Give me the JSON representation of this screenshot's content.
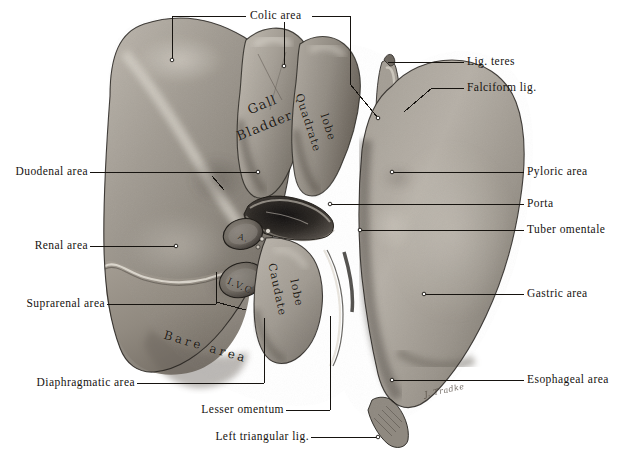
{
  "figure": {
    "type": "anatomical-illustration",
    "style": "halftone grayscale plate",
    "background_color": "#ffffff",
    "leader_line_color": "#1a1a1a",
    "signature": "J. Tradke"
  },
  "labels": {
    "top": [
      {
        "id": "colic-area",
        "text": "Colic area",
        "x": 277,
        "y": 12,
        "align": "center"
      }
    ],
    "right": [
      {
        "id": "lig-teres",
        "text": "Lig. teres",
        "x": 467,
        "y": 56
      },
      {
        "id": "falciform-lig",
        "text": "Falciform lig.",
        "x": 467,
        "y": 82
      },
      {
        "id": "pyloric-area",
        "text": "Pyloric area",
        "x": 527,
        "y": 166
      },
      {
        "id": "porta",
        "text": "Porta",
        "x": 527,
        "y": 198
      },
      {
        "id": "tuber-omentale",
        "text": "Tuber omentale",
        "x": 527,
        "y": 224
      },
      {
        "id": "gastric-area",
        "text": "Gastric area",
        "x": 527,
        "y": 288
      },
      {
        "id": "esophageal-area",
        "text": "Esophageal area",
        "x": 527,
        "y": 374
      }
    ],
    "left": [
      {
        "id": "duodenal-area",
        "text": "Duodenal area",
        "x": 96,
        "y": 166
      },
      {
        "id": "renal-area",
        "text": "Renal area",
        "x": 96,
        "y": 240
      },
      {
        "id": "suprarenal-area",
        "text": "Suprarenal area",
        "x": 113,
        "y": 298
      },
      {
        "id": "diaphragmatic-area",
        "text": "Diaphragmatic area",
        "x": 143,
        "y": 377
      }
    ],
    "bottom": [
      {
        "id": "lesser-omentum",
        "text": "Lesser omentum",
        "x": 292,
        "y": 404
      },
      {
        "id": "left-triangular-lig",
        "text": "Left triangular lig.",
        "x": 317,
        "y": 433
      }
    ],
    "in_figure": [
      {
        "id": "gall-bladder-1",
        "text": "Gall",
        "x": 247,
        "y": 97,
        "rotate": -22,
        "size": 13
      },
      {
        "id": "gall-bladder-2",
        "text": "Bladder",
        "x": 235,
        "y": 118,
        "rotate": -22,
        "size": 13
      },
      {
        "id": "quadrate-lobe-1",
        "text": "Quadrate",
        "x": 305,
        "y": 92,
        "rotate": 72,
        "size": 11
      },
      {
        "id": "quadrate-lobe-2",
        "text": "lobe",
        "x": 328,
        "y": 114,
        "rotate": 72,
        "size": 11
      },
      {
        "id": "caudate-lobe-1",
        "text": "Caudate",
        "x": 278,
        "y": 272,
        "rotate": 78,
        "size": 11
      },
      {
        "id": "caudate-lobe-2",
        "text": "lobe",
        "x": 298,
        "y": 286,
        "rotate": 78,
        "size": 11
      },
      {
        "id": "bare-area",
        "text": "Bare area",
        "x": 166,
        "y": 330,
        "rotate": 16,
        "size": 12
      },
      {
        "id": "ivc-lower",
        "text": "I.V.C.",
        "x": 233,
        "y": 278,
        "rotate": 24,
        "size": 9
      },
      {
        "id": "ivc-upper",
        "text": "A.",
        "x": 240,
        "y": 233,
        "rotate": 20,
        "size": 8
      }
    ]
  }
}
